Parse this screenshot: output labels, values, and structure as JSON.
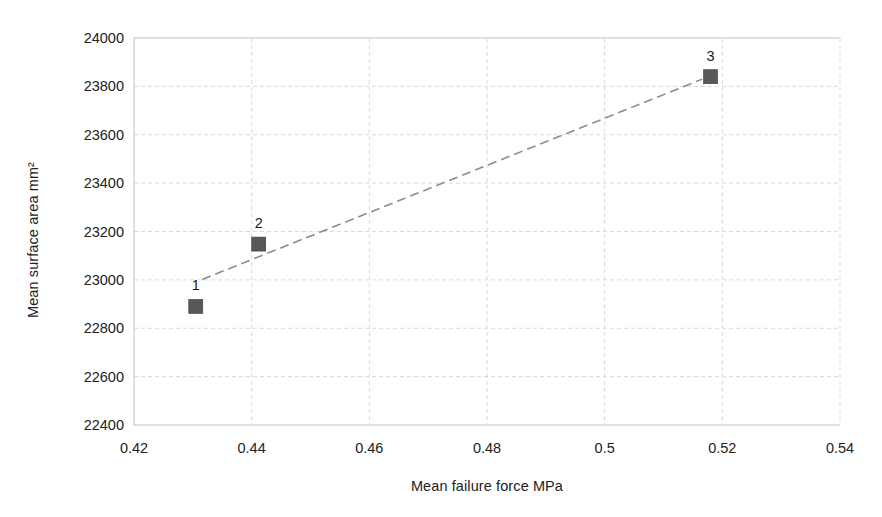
{
  "chart_data": {
    "type": "scatter",
    "title": "",
    "xlabel": "Mean failure force MPa",
    "ylabel": "Mean surface area mm²",
    "xlim": [
      0.42,
      0.54
    ],
    "ylim": [
      22400,
      24000
    ],
    "xticks": [
      "0.42",
      "0.44",
      "0.46",
      "0.48",
      "0.5",
      "0.52",
      "0.54"
    ],
    "xtick_values": [
      0.42,
      0.44,
      0.46,
      0.48,
      0.5,
      0.52,
      0.54
    ],
    "yticks": [
      "24000",
      "23800",
      "23600",
      "23400",
      "23200",
      "23000",
      "22800",
      "22600",
      "22400"
    ],
    "ytick_values": [
      24000,
      23800,
      23600,
      23400,
      23200,
      23000,
      22800,
      22600,
      22400
    ],
    "grid": true,
    "legend": "none",
    "points": [
      {
        "label": "1",
        "x": 0.4305,
        "y": 22890
      },
      {
        "label": "2",
        "x": 0.4412,
        "y": 23148
      },
      {
        "label": "3",
        "x": 0.518,
        "y": 23840
      }
    ],
    "series": [
      {
        "name": "Data points",
        "marker": "square",
        "marker_color": "#585858",
        "x": [
          0.4305,
          0.4412,
          0.518
        ],
        "values": [
          22890,
          23148,
          23840
        ]
      },
      {
        "name": "Trendline",
        "style": "dashed",
        "color": "#8c8c8c",
        "x": [
          0.4316,
          0.5166
        ],
        "values": [
          23002,
          23830
        ]
      }
    ],
    "colors": {
      "marker": "#585858",
      "trendline": "#8c8c8c",
      "grid": "#d9d9d9",
      "axis": "#bfbfbf",
      "text": "#1a1a1a",
      "background": "#ffffff"
    }
  }
}
